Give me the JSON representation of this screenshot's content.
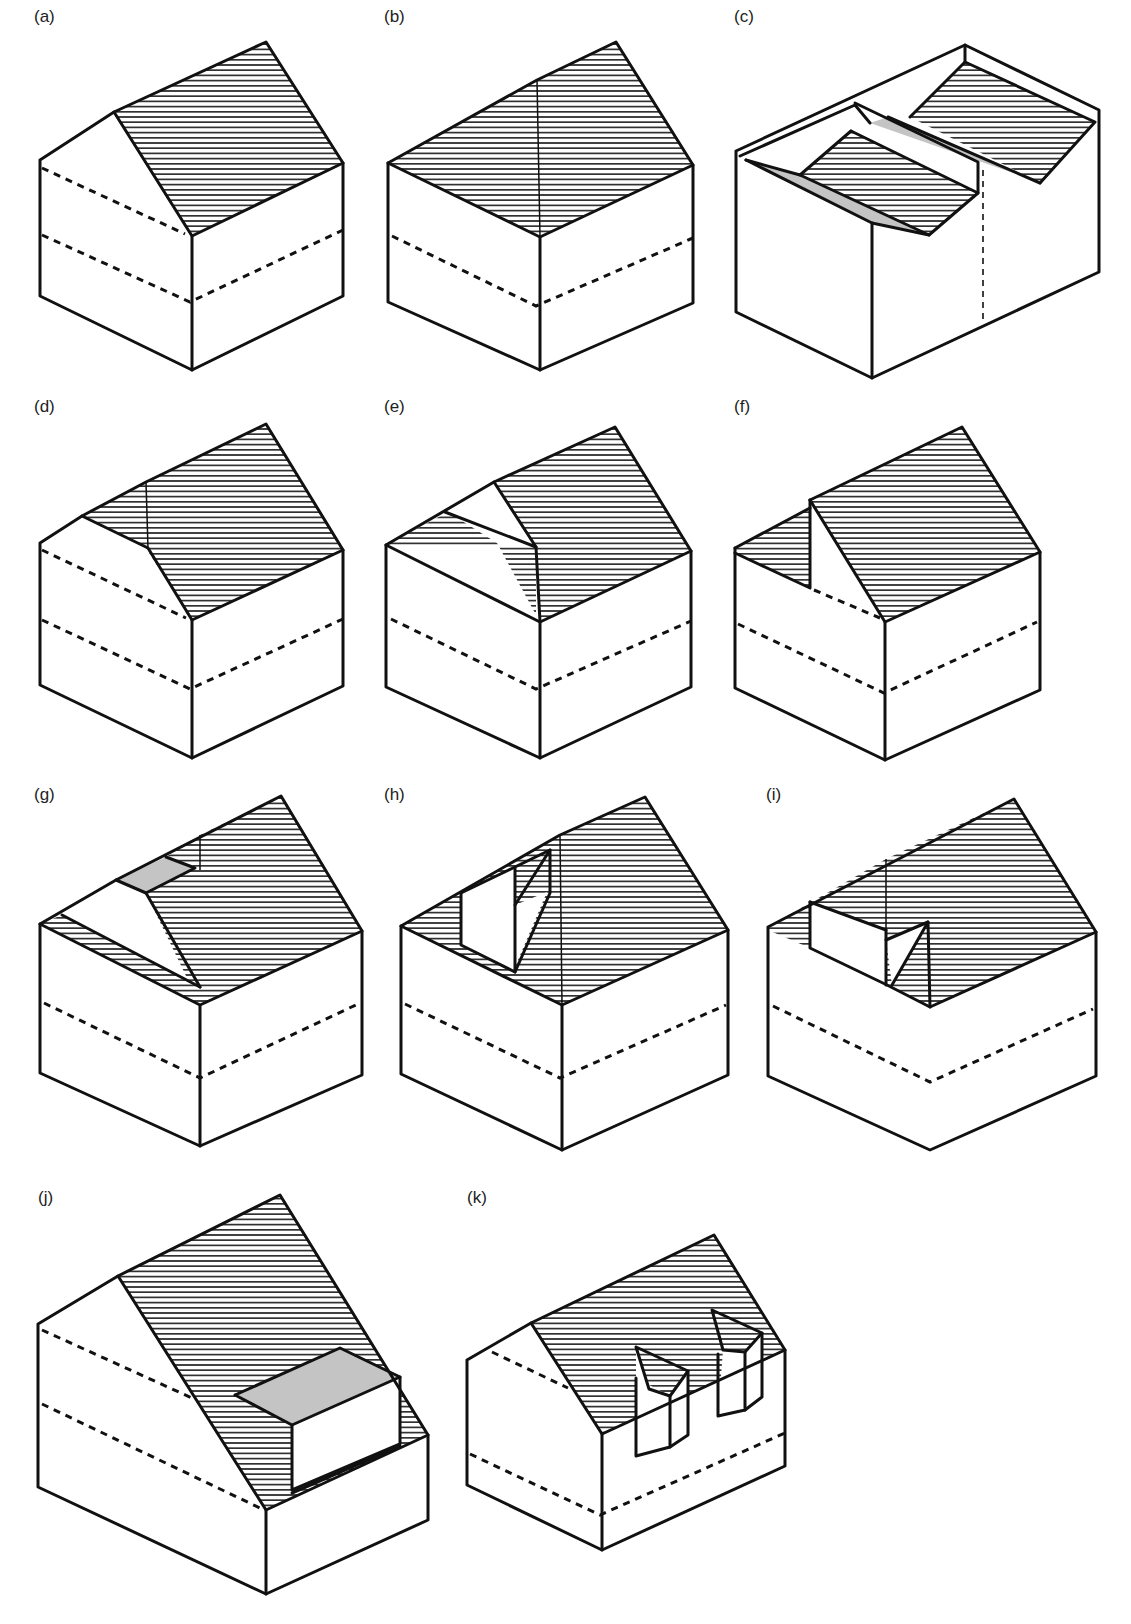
{
  "figure": {
    "colors": {
      "line": "#111111",
      "wall": "#ffffff",
      "hatch": "#111111",
      "flat_gray": "#c4c4c4"
    },
    "panels": [
      {
        "id": "a",
        "label": "(a)",
        "label_pos": [
          34,
          22
        ],
        "polys": [
          {
            "pts": "40,160 114,112 192,236 192,370 40,296",
            "fill": "wall"
          },
          {
            "pts": "192,236 343,163 343,296 192,370",
            "fill": "wall"
          },
          {
            "pts": "114,112 266,42 343,163 192,236",
            "fill": "hatch"
          }
        ],
        "edges": [
          "40,160 114,112 266,42 343,163 343,296 192,370 40,296 40,160",
          "114,112 192,236 343,163",
          "192,236 192,370"
        ],
        "dashes": [
          "42,168 185,234",
          "42,235 190,302 343,230"
        ]
      },
      {
        "id": "b",
        "label": "(b)",
        "label_pos": [
          384,
          22
        ],
        "polys": [
          {
            "pts": "388,163 540,237 540,370 388,302",
            "fill": "wall"
          },
          {
            "pts": "540,237 693,165 693,303 540,370",
            "fill": "wall"
          },
          {
            "pts": "388,163 537,80 540,237",
            "fill": "hatch"
          },
          {
            "pts": "537,80 616,42 693,165 540,237",
            "fill": "hatch"
          }
        ],
        "edges": [
          "388,163 537,80 616,42 693,165 693,303 540,370 388,302 388,163",
          "388,163 540,237 693,165",
          "540,237 540,370"
        ],
        "thin": [
          "537,80 540,237"
        ],
        "dashes": [
          "392,236 536,306 693,238"
        ]
      },
      {
        "id": "c",
        "label": "(c)",
        "label_pos": [
          734,
          22
        ],
        "polys": [
          {
            "pts": "736,151 965,45 1099,110 1099,272 872,378 736,312",
            "fill": "wall"
          },
          {
            "pts": "746,160 800,175 929,235 872,223",
            "fill": "gray"
          },
          {
            "pts": "800,175 851,131 978,193 929,235",
            "fill": "hatch"
          },
          {
            "pts": "870,123 888,117 1040,183 1016,174",
            "fill": "gray"
          },
          {
            "pts": "910,117 965,62 1095,122 1040,183",
            "fill": "hatch"
          }
        ],
        "edges": [
          "736,151 965,45 1099,110 1099,272 872,378 736,312 736,151",
          "872,223 872,378",
          "746,160 800,175 851,131",
          "800,175 929,235 978,193 851,131",
          "746,160 872,223 929,235",
          "855,103 978,162 978,193",
          "910,117 965,62 1095,122 1040,183",
          "888,117 1040,183",
          "740,156 855,105 870,123",
          "965,62 965,45"
        ],
        "dash_thin": [
          "983,170 983,322"
        ]
      },
      {
        "id": "d",
        "label": "(d)",
        "label_pos": [
          34,
          412
        ],
        "polys": [
          {
            "pts": "40,543 82,516 192,620 192,758 40,685",
            "fill": "wall"
          },
          {
            "pts": "192,620 343,550 343,686 192,758",
            "fill": "wall"
          },
          {
            "pts": "82,516 146,482 148,548",
            "fill": "hatch"
          },
          {
            "pts": "146,482 266,424 343,550 192,620 146,548",
            "fill": "hatch"
          }
        ],
        "edges": [
          "40,543 82,516 146,482 266,424 343,550 343,686 192,758 40,685 40,543",
          "82,516 148,548 192,620 343,550",
          "192,620 192,758"
        ],
        "thin": [
          "146,482 148,548"
        ],
        "dashes": [
          "42,550 186,618",
          "42,620 190,689 343,619"
        ]
      },
      {
        "id": "e",
        "label": "(e)",
        "label_pos": [
          384,
          412
        ],
        "polys": [
          {
            "pts": "386,545 540,622 540,758 386,687",
            "fill": "wall"
          },
          {
            "pts": "540,622 691,551 691,687 540,758",
            "fill": "wall"
          },
          {
            "pts": "386,545 448,512 497,543 536,615 536,547",
            "fill": "hatch"
          },
          {
            "pts": "445,512 494,482 536,547",
            "fill": "wall"
          },
          {
            "pts": "494,482 615,427 691,551 540,622 536,547",
            "fill": "hatch"
          }
        ],
        "edges": [
          "386,545 494,482 615,427 691,551 691,687 540,758 386,687 386,545",
          "386,545 540,622 691,551",
          "494,482 536,547 540,622",
          "540,622 540,758",
          "445,512 536,547"
        ],
        "dashes": [
          "391,619 536,689 691,621"
        ]
      },
      {
        "id": "f",
        "label": "(f)",
        "label_pos": [
          734,
          412
        ],
        "polys": [
          {
            "pts": "735,548 810,508 810,587 735,553",
            "fill": "hatch"
          },
          {
            "pts": "735,553 810,588 810,500 885,622 885,760 735,688",
            "fill": "wall"
          },
          {
            "pts": "885,622 1040,552 1040,690 885,760",
            "fill": "wall"
          },
          {
            "pts": "810,500 962,427 1040,552 885,622",
            "fill": "hatch"
          }
        ],
        "edges": [
          "735,548 810,508",
          "810,500 962,427 1040,552 1040,690 885,760 735,688 735,548",
          "735,553 810,588 810,500",
          "810,500 885,622 1040,552",
          "885,622 885,760"
        ],
        "dashes": [
          "814,590 880,618",
          "738,624 884,693 1037,622"
        ]
      },
      {
        "id": "g",
        "label": "(g)",
        "label_pos": [
          34,
          800
        ],
        "polys": [
          {
            "pts": "40,924 200,1005 200,1146 40,1073",
            "fill": "wall"
          },
          {
            "pts": "200,1005 362,931 362,1075 200,1146",
            "fill": "wall"
          },
          {
            "pts": "40,924 62,915 200,987 200,1005",
            "fill": "hatch"
          },
          {
            "pts": "62,915 116,880 146,893 200,987",
            "fill": "wall"
          },
          {
            "pts": "116,880 166,857 195,868 146,893",
            "fill": "gray"
          },
          {
            "pts": "166,857 200,835 200,868",
            "fill": "hatch"
          },
          {
            "pts": "146,893 195,868 200,835 281,796 362,931 200,1005",
            "fill": "hatch"
          }
        ],
        "edges": [
          "40,924 116,880 281,796 362,931 362,1075 200,1146 40,1073 40,924",
          "40,924 200,1005 362,931",
          "200,1005 200,1146",
          "116,880 146,893 200,987",
          "146,893 195,868 166,857",
          "62,915 200,987"
        ],
        "thin": [
          "200,835 200,870"
        ],
        "dashes": [
          "44,1003 200,1078 360,1003"
        ]
      },
      {
        "id": "h",
        "label": "(h)",
        "label_pos": [
          384,
          800
        ],
        "polys": [
          {
            "pts": "401,926 562,1005 562,1150 401,1074",
            "fill": "wall"
          },
          {
            "pts": "562,1005 728,930 728,1075 562,1150",
            "fill": "wall"
          },
          {
            "pts": "401,926 560,835 562,1005",
            "fill": "hatch"
          },
          {
            "pts": "560,835 645,797 728,930 562,1005",
            "fill": "hatch"
          },
          {
            "pts": "461,893 515,868 515,972 461,945",
            "fill": "wall"
          },
          {
            "pts": "515,905 547,892 515,967",
            "fill": "wall"
          }
        ],
        "edges": [
          "401,926 560,835 645,797 728,930 728,1075 562,1150 401,1074 401,926",
          "401,926 562,1005 728,930",
          "562,1005 562,1150",
          "461,893 461,945 515,972 515,868",
          "515,905 550,850 550,893 515,972",
          "461,893 550,850"
        ],
        "thin": [
          "560,835 562,1005"
        ],
        "dashes": [
          "405,1004 560,1078 726,1005"
        ]
      },
      {
        "id": "i",
        "label": "(i)",
        "label_pos": [
          766,
          800
        ],
        "polys": [
          {
            "pts": "768,927 887,983 930,1007 930,1150 768,1076",
            "fill": "wall"
          },
          {
            "pts": "930,1007 1096,932 1096,1076 930,1150",
            "fill": "wall"
          },
          {
            "pts": "768,927 886,859 886,930 810,948 768,930",
            "fill": "hatch"
          },
          {
            "pts": "886,859 1014,799 1096,932 930,1007 886,985",
            "fill": "hatch"
          },
          {
            "pts": "810,902 886,930 886,985 810,948",
            "fill": "wall"
          },
          {
            "pts": "886,940 928,922 892,985",
            "fill": "wall"
          }
        ],
        "edges": [
          "768,927 1014,799 1096,932 1096,1076 930,1150 768,1076 768,927",
          "810,902 810,948 887,985 930,1007 1096,932",
          "886,930 886,985",
          "886,940 928,922 930,1007",
          "892,985 928,922",
          "810,902 886,930"
        ],
        "thin": [
          "886,859 886,930",
          "928,922 930,1007"
        ],
        "dashes": [
          "773,1006 930,1082 1093,1009"
        ]
      },
      {
        "id": "j",
        "label": "(j)",
        "label_pos": [
          38,
          1203
        ],
        "polys": [
          {
            "pts": "38,1324 118,1276 266,1510 266,1578 38,1487",
            "fill": "wall"
          },
          {
            "pts": "266,1510 428,1435 428,1517 266,1592",
            "fill": "wall"
          },
          {
            "pts": "118,1276 280,1195 428,1435 266,1510",
            "fill": "hatch"
          },
          {
            "pts": "235,1395 340,1348 400,1377 292,1425",
            "fill": "gray"
          },
          {
            "pts": "292,1425 400,1377 400,1444 292,1490",
            "fill": "wall"
          },
          {
            "pts": "235,1395 292,1425 292,1490",
            "fill": "hatch"
          }
        ],
        "edges": [
          "38,1324 118,1276 280,1195 428,1435 428,1520 266,1594 38,1487 38,1324",
          "118,1276 266,1510 428,1435",
          "266,1510 266,1594",
          "235,1395 340,1348 400,1377 292,1425 235,1395",
          "292,1425 292,1490 400,1444 400,1377",
          "292,1493 400,1446"
        ],
        "dashes": [
          "42,1330 192,1398",
          "42,1404 262,1509"
        ]
      },
      {
        "id": "k",
        "label": "(k)",
        "label_pos": [
          467,
          1203
        ],
        "polys": [
          {
            "pts": "467,1360 531,1323 602,1434 602,1550 467,1485",
            "fill": "wall"
          },
          {
            "pts": "602,1434 785,1350 785,1466 602,1550",
            "fill": "wall"
          },
          {
            "pts": "531,1323 714,1235 785,1350 602,1434",
            "fill": "hatch"
          },
          {
            "pts": "636,1347 649,1389 670,1396 688,1371",
            "fill": "hatch"
          },
          {
            "pts": "636,1347 649,1389 636,1378",
            "fill": "wall"
          },
          {
            "pts": "636,1378 670,1396 670,1452 636,1456",
            "fill": "wall"
          },
          {
            "pts": "670,1396 688,1371 688,1435 670,1452",
            "fill": "wall"
          },
          {
            "pts": "712,1310 723,1350 745,1352 762,1333",
            "fill": "hatch"
          },
          {
            "pts": "723,1350 745,1352 745,1410 718,1416",
            "fill": "wall"
          },
          {
            "pts": "745,1352 762,1333 762,1397 745,1410",
            "fill": "wall"
          }
        ],
        "edges": [
          "467,1360 531,1323 714,1235 785,1350 785,1466 602,1550 467,1485 467,1360",
          "531,1323 602,1434 785,1350",
          "602,1434 602,1550",
          "636,1347 688,1371 670,1396 649,1389 636,1347",
          "636,1378 636,1456 670,1447 670,1396",
          "688,1371 688,1435 670,1447",
          "712,1310 762,1333 745,1352 723,1350 712,1310",
          "718,1354 718,1416 745,1410 745,1352",
          "762,1333 762,1397 745,1410"
        ],
        "dashes": [
          "492,1352 568,1388",
          "470,1454 600,1515 785,1433"
        ]
      }
    ]
  }
}
